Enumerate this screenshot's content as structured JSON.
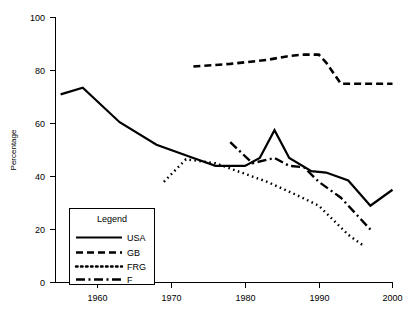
{
  "chart_data": {
    "type": "line",
    "title": "",
    "xlabel": "",
    "ylabel": "Percentage",
    "xlim": [
      1953,
      2001
    ],
    "ylim": [
      0,
      100
    ],
    "xticks": [
      1960,
      1970,
      1980,
      1990,
      2000
    ],
    "xtick_labels": [
      "1960",
      "1970",
      "1980",
      "1990",
      "2000"
    ],
    "yticks": [
      0,
      20,
      40,
      60,
      80,
      100
    ],
    "ytick_labels": [
      "0",
      "20",
      "40",
      "60",
      "80",
      "100"
    ],
    "grid": false,
    "legend_position": "lower-left-inside",
    "legend_title": "Legend",
    "series": [
      {
        "name": "USA",
        "style": "solid",
        "x": [
          1955,
          1958,
          1963,
          1968,
          1973,
          1976,
          1980,
          1982,
          1984,
          1986,
          1989,
          1991,
          1994,
          1997,
          2000
        ],
        "values": [
          71,
          73.5,
          60.5,
          52,
          47,
          44,
          44,
          47,
          57.5,
          47,
          42,
          41.5,
          38.5,
          29,
          35
        ]
      },
      {
        "name": "GB",
        "style": "dashed",
        "x": [
          1973,
          1978,
          1983,
          1986,
          1988,
          1990,
          1991,
          1993,
          1996,
          2000
        ],
        "values": [
          81.5,
          82.5,
          84,
          85.5,
          86,
          86,
          83,
          75,
          75,
          75
        ]
      },
      {
        "name": "FRG",
        "style": "dotted",
        "x": [
          1969,
          1972,
          1976,
          1980,
          1983,
          1987,
          1990,
          1994,
          1996
        ],
        "values": [
          38,
          46.5,
          45,
          41,
          38,
          33,
          29,
          18,
          14
        ]
      },
      {
        "name": "F",
        "style": "dash-dot",
        "x": [
          1978,
          1981,
          1984,
          1986,
          1988,
          1990,
          1993,
          1997
        ],
        "values": [
          53,
          45,
          47,
          44,
          43.5,
          38,
          32,
          20
        ]
      }
    ]
  },
  "legend": {
    "title": "Legend",
    "entries": [
      {
        "label": "USA",
        "style": "solid"
      },
      {
        "label": "GB",
        "style": "dashed"
      },
      {
        "label": "FRG",
        "style": "dotted"
      },
      {
        "label": "F",
        "style": "dash-dot"
      }
    ]
  },
  "axes": {
    "y_title": "Percentage",
    "y_labels": [
      "100",
      "80",
      "60",
      "40",
      "20",
      "0"
    ],
    "x_labels": [
      "1960",
      "1970",
      "1980",
      "1990",
      "2000"
    ]
  },
  "colors": {
    "line": "#000000",
    "background": "#ffffff",
    "axis": "#000000"
  }
}
